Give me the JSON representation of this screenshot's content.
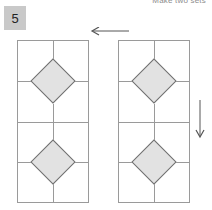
{
  "header": {
    "instruction": "Make two sets"
  },
  "badge": {
    "number": "5"
  },
  "colors": {
    "badge_bg": "#c9c9c9",
    "panel_border": "#9a9a9a",
    "grid_line": "#9a9a9a",
    "diamond_fill": "#e2e2e2",
    "diamond_stroke": "#6e6e6e",
    "arrow": "#555555",
    "header_text": "#8c8c8c",
    "page_bg": "#ffffff"
  },
  "diagram": {
    "panels": [
      {
        "id": "left-panel",
        "cells": [
          {
            "id": "left-cell-top",
            "shape": "diamond",
            "fill": "#e2e2e2"
          },
          {
            "id": "left-cell-bottom",
            "shape": "diamond",
            "fill": "#e2e2e2"
          }
        ]
      },
      {
        "id": "right-panel",
        "cells": [
          {
            "id": "right-cell-top",
            "shape": "diamond",
            "fill": "#e2e2e2"
          },
          {
            "id": "right-cell-bottom",
            "shape": "diamond",
            "fill": "#e2e2e2"
          }
        ]
      }
    ],
    "arrows": [
      {
        "id": "arrow-left",
        "direction": "left",
        "icon": "arrow-left-icon"
      },
      {
        "id": "arrow-down",
        "direction": "down",
        "icon": "arrow-down-icon"
      }
    ]
  }
}
